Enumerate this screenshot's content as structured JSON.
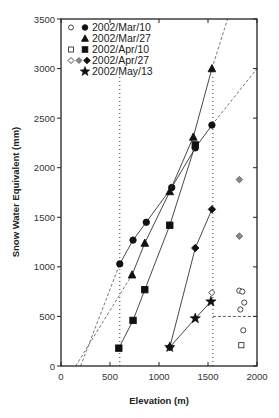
{
  "chart_data": {
    "type": "scatter",
    "title": "",
    "xlabel": "Elevation (m)",
    "ylabel": "Snow Water Equivalent (mm)",
    "xlim": [
      0,
      2000
    ],
    "ylim": [
      0,
      3500
    ],
    "xticks": [
      0,
      500,
      1000,
      1500,
      2000
    ],
    "yticks": [
      0,
      500,
      1000,
      1500,
      2000,
      2500,
      3000,
      3500
    ],
    "grid": false,
    "legend_position": "upper left",
    "series": [
      {
        "name": "2002/Mar/10",
        "marker": "circle",
        "color": "#111111",
        "x": [
          600,
          735,
          870,
          1130,
          1370,
          1540
        ],
        "y": [
          1030,
          1270,
          1450,
          1800,
          2200,
          2430
        ],
        "open_x": [
          1820,
          1850,
          1870,
          1830,
          1860
        ],
        "open_y": [
          760,
          750,
          640,
          570,
          360
        ]
      },
      {
        "name": "2002/Mar/27",
        "marker": "triangle",
        "color": "#111111",
        "x": [
          725,
          855,
          1110,
          1350,
          1540
        ],
        "y": [
          920,
          1240,
          1760,
          2310,
          3000
        ]
      },
      {
        "name": "2002/Apr/10",
        "marker": "square",
        "color": "#111111",
        "x": [
          590,
          735,
          855,
          1110,
          1370
        ],
        "y": [
          180,
          460,
          770,
          1420,
          2230
        ],
        "open_x": [
          1840
        ],
        "open_y": [
          210
        ]
      },
      {
        "name": "2002/Apr/27",
        "marker": "diamond",
        "color": "#111111",
        "x": [
          1110,
          1370,
          1540
        ],
        "y": [
          190,
          1190,
          1580
        ],
        "gray_x": [
          1820,
          1820
        ],
        "gray_y": [
          1880,
          1310
        ],
        "open_x": [
          1540
        ],
        "open_y": [
          740
        ]
      },
      {
        "name": "2002/May/13",
        "marker": "star",
        "color": "#111111",
        "x": [
          1110,
          1370,
          1530
        ],
        "y": [
          190,
          480,
          650
        ]
      }
    ],
    "reference_lines": {
      "vertical_dotted_x": [
        600,
        1550
      ],
      "horizontal_dashed": {
        "y": 500,
        "x_from": 1550,
        "x_to": 2000
      },
      "dashed_extrapolations": [
        {
          "from": [
            200,
            0
          ],
          "to": [
            600,
            1030
          ],
          "note": "Mar/10 low"
        },
        {
          "from": [
            1540,
            2430
          ],
          "to": [
            2000,
            3000
          ],
          "note": "Mar/10 high"
        },
        {
          "from": [
            150,
            0
          ],
          "to": [
            725,
            920
          ],
          "note": "Mar/27 low"
        },
        {
          "from": [
            1540,
            3000
          ],
          "to": [
            1700,
            3500
          ],
          "note": "Mar/27 high"
        }
      ]
    }
  },
  "legend": {
    "items": [
      {
        "label": "2002/Mar/10",
        "open": "○",
        "filled": "●"
      },
      {
        "label": "2002/Mar/27",
        "open": "",
        "filled": "▲"
      },
      {
        "label": "2002/Apr/10",
        "open": "□",
        "filled": "■"
      },
      {
        "label": "2002/Apr/27",
        "open": "◇",
        "filled": "◆"
      },
      {
        "label": "2002/May/13",
        "open": "",
        "filled": "★"
      }
    ]
  }
}
